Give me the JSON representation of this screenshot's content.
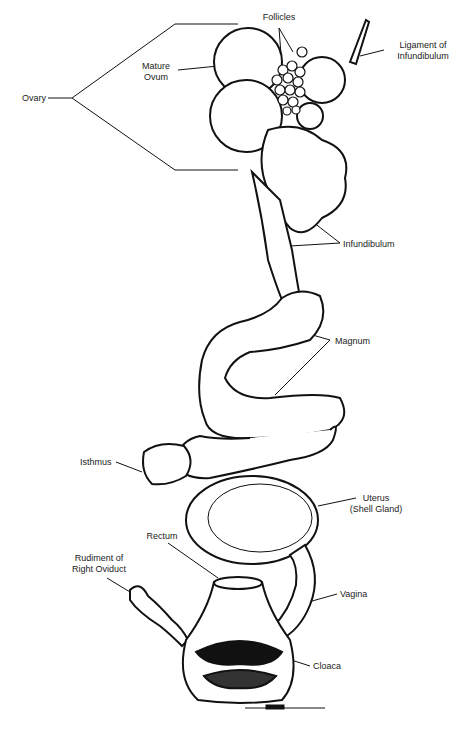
{
  "figure": {
    "colors": {
      "ink": "#111111",
      "paper": "#ffffff",
      "label": "#222222"
    },
    "labels": {
      "ovary": "Ovary",
      "follicles": "Follicles",
      "mature_ovum": "Mature\nOvum",
      "ligament_of_infundibulum": "Ligament of\nInfundibulum",
      "infundibulum": "Infundibulum",
      "magnum": "Magnum",
      "isthmus": "Isthmus",
      "uterus": "Uterus\n(Shell Gland)",
      "rectum": "Rectum",
      "rudiment_of_right_oviduct": "Rudiment of\nRight Oviduct",
      "vagina": "Vagina",
      "cloaca": "Cloaca"
    }
  }
}
